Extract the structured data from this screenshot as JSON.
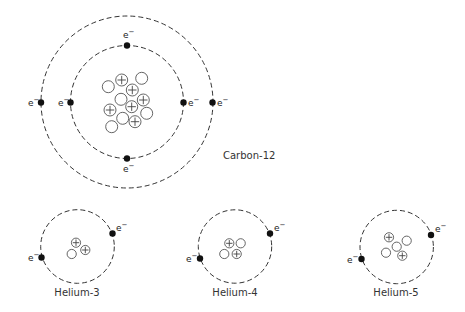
{
  "diagram": {
    "colors": {
      "orbit": "#333333",
      "electron": "#111111",
      "particle_stroke": "#555555",
      "text": "#333333"
    },
    "legend": {
      "proton_symbol": "+",
      "electron_label": "e",
      "electron_charge": "−"
    },
    "atoms": [
      {
        "name": "Carbon-12",
        "label": "Carbon-12",
        "center": [
          127,
          102
        ],
        "label_pos": [
          223,
          159
        ],
        "label_anchor": "start",
        "orbits": [
          56.5,
          86
        ],
        "electrons": [
          {
            "x": 127,
            "y": 45.5,
            "label_x": 123,
            "label_y": 38,
            "label_side": "above"
          },
          {
            "x": 127,
            "y": 158.5,
            "label_x": 123,
            "label_y": 172,
            "label_side": "below"
          },
          {
            "x": 70.5,
            "y": 102.5,
            "label_x": 58,
            "label_y": 105.5,
            "label_side": "left"
          },
          {
            "x": 183.5,
            "y": 102.5,
            "label_x": 188,
            "label_y": 105.5,
            "label_side": "right"
          },
          {
            "x": 41,
            "y": 102.5,
            "label_x": 28,
            "label_y": 105.5,
            "label_side": "left"
          },
          {
            "x": 212.5,
            "y": 102.5,
            "label_x": 217,
            "label_y": 105.5,
            "label_side": "right"
          }
        ],
        "particle_radius": 6,
        "nucleus": [
          {
            "x": 121.7,
            "y": 80,
            "type": "proton"
          },
          {
            "x": 141.7,
            "y": 78.3,
            "type": "neutron"
          },
          {
            "x": 108.3,
            "y": 86.7,
            "type": "neutron"
          },
          {
            "x": 132.3,
            "y": 90,
            "type": "proton"
          },
          {
            "x": 121,
            "y": 99.3,
            "type": "neutron"
          },
          {
            "x": 143.3,
            "y": 100,
            "type": "proton"
          },
          {
            "x": 110,
            "y": 110,
            "type": "proton"
          },
          {
            "x": 131.7,
            "y": 106.7,
            "type": "proton"
          },
          {
            "x": 146.7,
            "y": 113.3,
            "type": "neutron"
          },
          {
            "x": 122.7,
            "y": 118.3,
            "type": "neutron"
          },
          {
            "x": 135,
            "y": 121.7,
            "type": "proton"
          },
          {
            "x": 111.7,
            "y": 126.7,
            "type": "neutron"
          }
        ]
      },
      {
        "name": "Helium-3",
        "label": "Helium-3",
        "center": [
          77.5,
          246.5
        ],
        "label_pos": [
          77,
          296
        ],
        "label_anchor": "middle",
        "orbits": [
          36.8
        ],
        "electrons": [
          {
            "x": 112.5,
            "y": 233.5,
            "label_x": 116,
            "label_y": 231,
            "label_side": "right"
          },
          {
            "x": 41.5,
            "y": 257.5,
            "label_x": 28,
            "label_y": 261,
            "label_side": "left"
          }
        ],
        "particle_radius": 4.6,
        "nucleus": [
          {
            "x": 76,
            "y": 242.7,
            "type": "proton"
          },
          {
            "x": 85.3,
            "y": 250,
            "type": "proton"
          },
          {
            "x": 71.7,
            "y": 254,
            "type": "neutron"
          }
        ]
      },
      {
        "name": "Helium-4",
        "label": "Helium-4",
        "center": [
          235,
          246.5
        ],
        "label_pos": [
          235,
          296
        ],
        "label_anchor": "middle",
        "orbits": [
          36.7
        ],
        "electrons": [
          {
            "x": 270,
            "y": 233.5,
            "label_x": 274,
            "label_y": 231,
            "label_side": "right"
          },
          {
            "x": 200,
            "y": 258.5,
            "label_x": 186,
            "label_y": 262,
            "label_side": "left"
          }
        ],
        "particle_radius": 4.6,
        "nucleus": [
          {
            "x": 229.3,
            "y": 243.3,
            "type": "proton"
          },
          {
            "x": 240.7,
            "y": 243.3,
            "type": "neutron"
          },
          {
            "x": 224.3,
            "y": 254,
            "type": "neutron"
          },
          {
            "x": 236.7,
            "y": 254,
            "type": "proton"
          }
        ]
      },
      {
        "name": "Helium-5",
        "label": "Helium-5",
        "center": [
          396.7,
          247
        ],
        "label_pos": [
          396,
          296
        ],
        "label_anchor": "middle",
        "orbits": [
          36.7
        ],
        "electrons": [
          {
            "x": 431,
            "y": 235,
            "label_x": 435,
            "label_y": 232,
            "label_side": "right"
          },
          {
            "x": 361.5,
            "y": 259,
            "label_x": 347,
            "label_y": 263,
            "label_side": "left"
          }
        ],
        "particle_radius": 4.6,
        "nucleus": [
          {
            "x": 389,
            "y": 237.3,
            "type": "proton"
          },
          {
            "x": 406.7,
            "y": 240.7,
            "type": "neutron"
          },
          {
            "x": 396.7,
            "y": 246.7,
            "type": "neutron"
          },
          {
            "x": 386,
            "y": 252.7,
            "type": "neutron"
          },
          {
            "x": 402.3,
            "y": 255.7,
            "type": "proton"
          }
        ]
      }
    ]
  }
}
